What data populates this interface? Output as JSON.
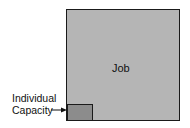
{
  "diagram": {
    "job": {
      "label": "Job",
      "fill": "#b5b5b5",
      "stroke": "#1a1a1a"
    },
    "individual_capacity": {
      "label_line1": "Individual",
      "label_line2": "Capacity",
      "fill": "#8c8c8c",
      "stroke": "#1a1a1a"
    },
    "arrow": {
      "direction": "right",
      "color": "#111111"
    }
  }
}
